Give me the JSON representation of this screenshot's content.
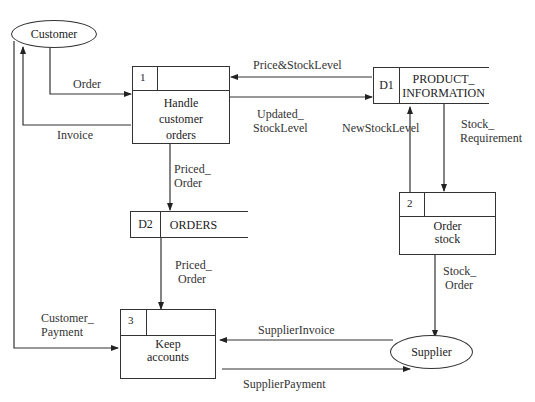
{
  "entities": {
    "customer": {
      "label": "Customer"
    },
    "supplier": {
      "label": "Supplier"
    }
  },
  "processes": [
    {
      "number": "1",
      "name_line1": "Handle",
      "name_line2": "customer",
      "name_line3": "orders"
    },
    {
      "number": "2",
      "name_line1": "Order",
      "name_line2": "stock"
    },
    {
      "number": "3",
      "name_line1": "Keep",
      "name_line2": "accounts"
    }
  ],
  "stores": [
    {
      "id": "D1",
      "name_line1": "PRODUCT_",
      "name_line2": "INFORMATION"
    },
    {
      "id": "D2",
      "name_line1": "ORDERS"
    }
  ],
  "flows": {
    "order": "Order",
    "invoice": "Invoice",
    "price_stock_level": "Price&StockLevel",
    "updated_stock_level_1": "Updated_",
    "updated_stock_level_2": "StockLevel",
    "new_stock_level": "NewStockLevel",
    "stock_requirement_1": "Stock_",
    "stock_requirement_2": "Requirement",
    "priced_order_a1": "Priced_",
    "priced_order_a2": "Order",
    "priced_order_b1": "Priced_",
    "priced_order_b2": "Order",
    "stock_order_1": "Stock_",
    "stock_order_2": "Order",
    "customer_payment_1": "Customer_",
    "customer_payment_2": "Payment",
    "supplier_invoice": "SupplierInvoice",
    "supplier_payment": "SupplierPayment"
  }
}
